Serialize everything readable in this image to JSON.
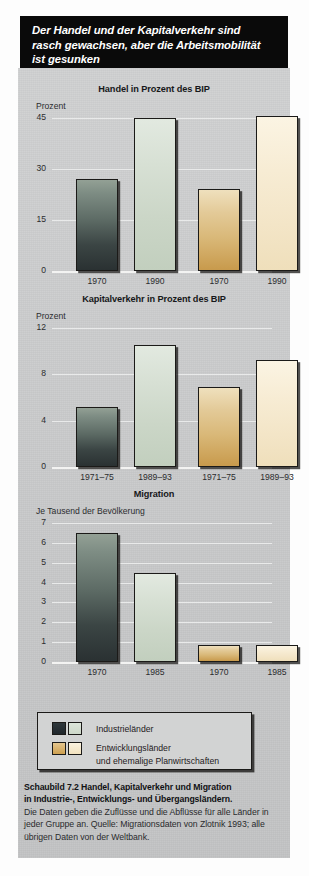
{
  "banner": {
    "line1": "Der Handel und der Kapitalverkehr sind",
    "line2": "rasch gewachsen, aber die Arbeitsmobilität",
    "line3": "ist gesunken"
  },
  "legend": {
    "item1": "Industrieländer",
    "item2_line1": "Entwicklungsländer",
    "item2_line2": "und ehemalige Planwirtschaften"
  },
  "caption": {
    "bold_line1": "Schaubild 7.2    Handel, Kapitalverkehr und Migration",
    "bold_line2": "in Industrie-, Entwicklungs- und Übergangsländern.",
    "body": "Die Daten geben die Zuflüsse und die Abflüsse für alle Länder in jeder Gruppe an. Quelle: Migrationsdaten von Zlotnik 1993; alle übrigen Daten von der Weltbank."
  },
  "colors": {
    "panel_gray": "#c9cacb",
    "banner_black": "#0a0a0a",
    "industrial_dark": "#3b4544",
    "industrial_light": "#cbd6c7",
    "developing_dark": "#d9b878",
    "developing_light": "#f3e5c7",
    "gridline": "#e9eaea"
  },
  "chart_data": [
    {
      "type": "bar",
      "title": "Handel in Prozent des BIP",
      "ylabel": "Prozent",
      "xlabel": "",
      "ylim": [
        0,
        45
      ],
      "yticks": [
        0,
        15,
        30,
        45
      ],
      "ytick_labels": [
        "0",
        "15",
        "30",
        "45"
      ],
      "grid": true,
      "groups": [
        {
          "group": "Industrieländer",
          "categories": [
            "1970",
            "1990"
          ],
          "values": [
            27,
            45
          ]
        },
        {
          "group": "Entwicklungsländer und ehemalige Planwirtschaften",
          "categories": [
            "1970",
            "1990"
          ],
          "values": [
            24,
            45.5
          ]
        }
      ],
      "legend_position": "bottom-shared"
    },
    {
      "type": "bar",
      "title": "Kapitalverkehr in Prozent des BIP",
      "ylabel": "Prozent",
      "xlabel": "",
      "ylim": [
        0,
        12
      ],
      "yticks": [
        0,
        4,
        8,
        12
      ],
      "ytick_labels": [
        "0",
        "4",
        "8",
        "12"
      ],
      "grid": true,
      "groups": [
        {
          "group": "Industrieländer",
          "categories": [
            "1971–75",
            "1989–93"
          ],
          "values": [
            5.2,
            10.5
          ]
        },
        {
          "group": "Entwicklungsländer und ehemalige Planwirtschaften",
          "categories": [
            "1971–75",
            "1989–93"
          ],
          "values": [
            6.9,
            9.2
          ]
        }
      ],
      "legend_position": "bottom-shared"
    },
    {
      "type": "bar",
      "title": "Migration",
      "ylabel": "Je Tausend der Bevölkerung",
      "xlabel": "",
      "ylim": [
        0,
        7
      ],
      "yticks": [
        0,
        1,
        2,
        3,
        4,
        5,
        6,
        7
      ],
      "ytick_labels": [
        "0",
        "1",
        "2",
        "3",
        "4",
        "5",
        "6",
        "7"
      ],
      "grid": true,
      "groups": [
        {
          "group": "Industrieländer",
          "categories": [
            "1970",
            "1985"
          ],
          "values": [
            6.5,
            4.5
          ]
        },
        {
          "group": "Entwicklungsländer und ehemalige Planwirtschaften",
          "categories": [
            "1970",
            "1985"
          ],
          "values": [
            0.85,
            0.85
          ]
        }
      ],
      "legend_position": "bottom-shared"
    }
  ]
}
